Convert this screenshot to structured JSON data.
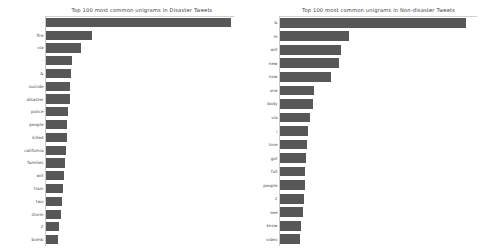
{
  "figure": {
    "background_color": "#ffffff",
    "bar_color": "#575757",
    "axis_color": "#c9c9c9"
  },
  "chart_data": [
    {
      "type": "bar",
      "orientation": "horizontal",
      "title": "Top 100 most common unigrams in Disaster Tweets",
      "xlabel": "",
      "ylabel": "",
      "grid": false,
      "legend": "none",
      "xlim": [
        0,
        700
      ],
      "categories": [
        "-",
        "fire",
        "via",
        "-",
        "&amp;",
        "suicide",
        "disaster",
        "police",
        "people",
        "killed",
        "california",
        "families",
        "will",
        "train",
        "two",
        "storm",
        "2",
        "bomb"
      ],
      "values": [
        690,
        170,
        130,
        95,
        93,
        90,
        88,
        82,
        80,
        78,
        74,
        70,
        66,
        62,
        58,
        55,
        50,
        44
      ]
    },
    {
      "type": "bar",
      "orientation": "horizontal",
      "title": "Top 100 most common unigrams in Non-disaster Tweets",
      "xlabel": "",
      "ylabel": "",
      "grid": false,
      "legend": "none",
      "xlim": [
        0,
        700
      ],
      "categories": [
        "&amp;",
        "m",
        "will",
        "new",
        "now",
        "one",
        "body",
        "via",
        "i",
        "love",
        "got",
        "full",
        "people",
        "2",
        "see",
        "know",
        "video"
      ],
      "values": [
        660,
        245,
        215,
        210,
        180,
        120,
        118,
        105,
        98,
        95,
        92,
        90,
        88,
        85,
        80,
        76,
        72
      ]
    }
  ]
}
